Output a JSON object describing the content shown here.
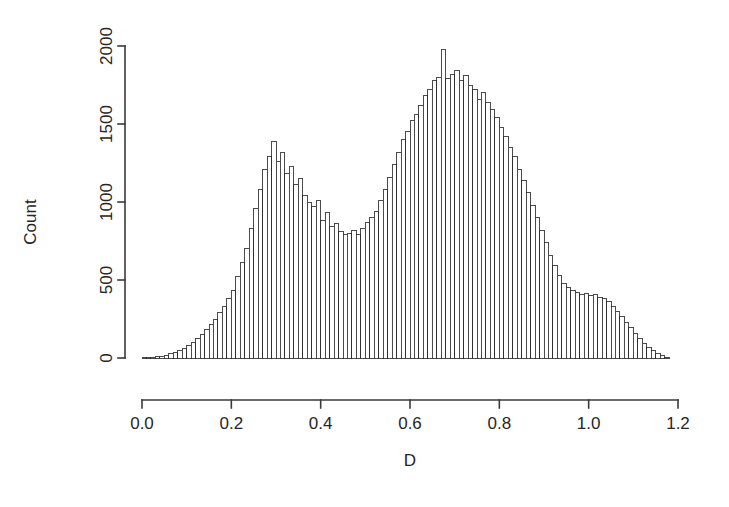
{
  "chart_data": {
    "type": "bar",
    "subtype": "histogram",
    "title": "",
    "subtitle": "",
    "xlabel": "D",
    "ylabel": "Count",
    "xlim": [
      0.0,
      1.2
    ],
    "ylim": [
      0,
      2100
    ],
    "xticks": [
      0.0,
      0.2,
      0.4,
      0.6,
      0.8,
      1.0,
      1.2
    ],
    "xtick_labels": [
      "0.0",
      "0.2",
      "0.4",
      "0.6",
      "0.8",
      "1.0",
      "1.2"
    ],
    "yticks": [
      0,
      500,
      1000,
      1500,
      2000
    ],
    "ytick_labels": [
      "0",
      "500",
      "1000",
      "1500",
      "2000"
    ],
    "grid": false,
    "legend": null,
    "annotations": [],
    "bin_width": 0.01,
    "bin_start": 0.0,
    "distribution": "bimodal",
    "categories": [
      0.005,
      0.015,
      0.025,
      0.035,
      0.045,
      0.055,
      0.065,
      0.075,
      0.085,
      0.095,
      0.105,
      0.115,
      0.125,
      0.135,
      0.145,
      0.155,
      0.165,
      0.175,
      0.185,
      0.195,
      0.205,
      0.215,
      0.225,
      0.235,
      0.245,
      0.255,
      0.265,
      0.275,
      0.285,
      0.295,
      0.305,
      0.315,
      0.325,
      0.335,
      0.345,
      0.355,
      0.365,
      0.375,
      0.385,
      0.395,
      0.405,
      0.415,
      0.425,
      0.435,
      0.445,
      0.455,
      0.465,
      0.475,
      0.485,
      0.495,
      0.505,
      0.515,
      0.525,
      0.535,
      0.545,
      0.555,
      0.565,
      0.575,
      0.585,
      0.595,
      0.605,
      0.615,
      0.625,
      0.635,
      0.645,
      0.655,
      0.665,
      0.675,
      0.685,
      0.695,
      0.705,
      0.715,
      0.725,
      0.735,
      0.745,
      0.755,
      0.765,
      0.775,
      0.785,
      0.795,
      0.805,
      0.815,
      0.825,
      0.835,
      0.845,
      0.855,
      0.865,
      0.875,
      0.885,
      0.895,
      0.905,
      0.915,
      0.925,
      0.935,
      0.945,
      0.955,
      0.965,
      0.975,
      0.985,
      0.995,
      1.005,
      1.015,
      1.025,
      1.035,
      1.045,
      1.055,
      1.065,
      1.075,
      1.085,
      1.095,
      1.105,
      1.115,
      1.125,
      1.135,
      1.145,
      1.155,
      1.165,
      1.175
    ],
    "values": [
      2,
      3,
      5,
      8,
      12,
      18,
      26,
      35,
      48,
      62,
      80,
      100,
      125,
      152,
      185,
      215,
      250,
      290,
      330,
      380,
      430,
      520,
      610,
      700,
      830,
      960,
      1080,
      1210,
      1290,
      1385,
      1260,
      1320,
      1180,
      1230,
      1110,
      1150,
      1040,
      1000,
      970,
      1010,
      880,
      930,
      840,
      860,
      810,
      790,
      800,
      820,
      790,
      830,
      870,
      900,
      940,
      1010,
      1080,
      1160,
      1240,
      1320,
      1400,
      1450,
      1520,
      1560,
      1620,
      1680,
      1720,
      1780,
      1800,
      1975,
      1790,
      1820,
      1840,
      1780,
      1810,
      1750,
      1720,
      1660,
      1700,
      1640,
      1590,
      1540,
      1480,
      1420,
      1350,
      1290,
      1210,
      1140,
      1060,
      980,
      900,
      820,
      740,
      660,
      590,
      530,
      480,
      450,
      430,
      420,
      410,
      415,
      400,
      405,
      390,
      380,
      360,
      330,
      300,
      265,
      230,
      195,
      160,
      125,
      95,
      68,
      45,
      28,
      15,
      6
    ]
  },
  "axes": {
    "x_label": "D",
    "y_label": "Count"
  }
}
